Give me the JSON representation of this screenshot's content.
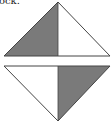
{
  "caption": {
    "text": "ock."
  },
  "diagram": {
    "colors": {
      "shade": "#7a7a7a",
      "stroke": "#444444",
      "background": "#ffffff"
    },
    "top_triangle": {
      "shaded_half": "left"
    },
    "bottom_triangle": {
      "shaded_half": "right"
    }
  }
}
